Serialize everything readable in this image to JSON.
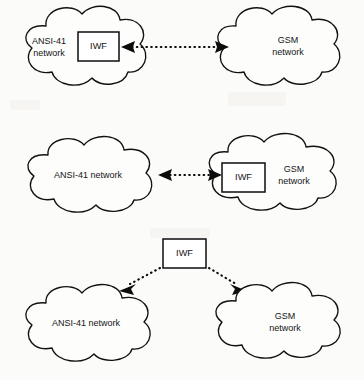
{
  "figure": {
    "background_color": "#fbfbf9",
    "line_color": "#111111",
    "text_color": "#141414"
  },
  "diagrams": [
    {
      "id": "iwf-in-ansi41-network",
      "left_cloud": {
        "label_line1": "ANSI-41",
        "label_line2": "network"
      },
      "right_cloud": {
        "label_line1": "GSM",
        "label_line2": "network"
      },
      "iwf_box": {
        "label": "IWF",
        "located_in": "left_cloud"
      },
      "connector": {
        "style": "dotted",
        "arrowheads": "both"
      }
    },
    {
      "id": "iwf-in-gsm-network",
      "left_cloud": {
        "label_line1": "ANSI-41 network",
        "label_line2": ""
      },
      "right_cloud": {
        "label_line1": "GSM",
        "label_line2": "network"
      },
      "iwf_box": {
        "label": "IWF",
        "located_in": "right_cloud"
      },
      "connector": {
        "style": "dotted",
        "arrowheads": "both"
      }
    },
    {
      "id": "iwf-standalone",
      "left_cloud": {
        "label_line1": "ANSI-41 network",
        "label_line2": ""
      },
      "right_cloud": {
        "label_line1": "GSM",
        "label_line2": "network"
      },
      "iwf_box": {
        "label": "IWF",
        "located_in": "standalone"
      },
      "connector": {
        "style": "dotted",
        "arrowheads": "single-each"
      }
    }
  ]
}
